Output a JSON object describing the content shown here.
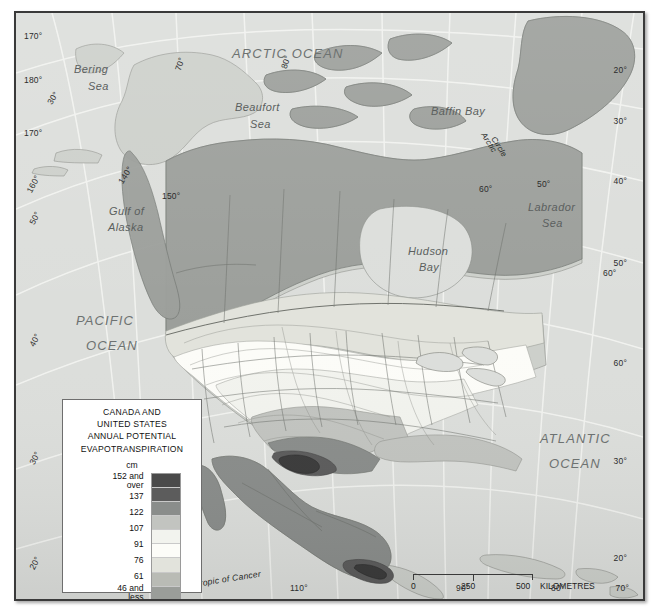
{
  "map": {
    "title_lines": [
      "CANADA AND",
      "UNITED STATES",
      "ANNUAL POTENTIAL",
      "EVAPOTRANSPIRATION"
    ],
    "unit": "cm",
    "legend": {
      "classes": [
        {
          "label_top": "152 and",
          "label_bottom": "over",
          "color": "#4a4a4a"
        },
        {
          "label_top": "137",
          "label_bottom": "",
          "color": "#5c5c5c"
        },
        {
          "label_top": "122",
          "label_bottom": "",
          "color": "#8a8d8b"
        },
        {
          "label_top": "107",
          "label_bottom": "",
          "color": "#c2c4c0"
        },
        {
          "label_top": "91",
          "label_bottom": "",
          "color": "#f2f3ee"
        },
        {
          "label_top": "76",
          "label_bottom": "",
          "color": "#fcfcf8"
        },
        {
          "label_top": "61",
          "label_bottom": "",
          "color": "#e2e3dc"
        },
        {
          "label_top": "46 and",
          "label_bottom": "less",
          "color": "#b9bbb5"
        },
        {
          "label_top": "",
          "label_bottom": "",
          "color": "#9a9d99"
        }
      ]
    },
    "scale": {
      "ticks": [
        "0",
        "250",
        "500"
      ],
      "unit_label": "KILOMETRES"
    },
    "features": [
      {
        "name": "arctic-ocean",
        "text": "ARCTIC OCEAN",
        "style": "big"
      },
      {
        "name": "pacific-ocean",
        "text": "PACIFIC",
        "style": "big"
      },
      {
        "name": "pacific-ocean-2",
        "text": "OCEAN",
        "style": "big"
      },
      {
        "name": "atlantic-ocean",
        "text": "ATLANTIC",
        "style": "big"
      },
      {
        "name": "atlantic-ocean-2",
        "text": "OCEAN",
        "style": "big"
      },
      {
        "name": "bering-sea",
        "text": "Bering",
        "style": "mid"
      },
      {
        "name": "bering-sea-2",
        "text": "Sea",
        "style": "mid"
      },
      {
        "name": "beaufort-sea",
        "text": "Beaufort",
        "style": "mid"
      },
      {
        "name": "beaufort-sea-2",
        "text": "Sea",
        "style": "mid"
      },
      {
        "name": "baffin-bay",
        "text": "Baffin Bay",
        "style": "mid"
      },
      {
        "name": "labrador-sea",
        "text": "Labrador",
        "style": "mid"
      },
      {
        "name": "labrador-sea-2",
        "text": "Sea",
        "style": "mid"
      },
      {
        "name": "hudson-bay",
        "text": "Hudson",
        "style": "mid"
      },
      {
        "name": "hudson-bay-2",
        "text": "Bay",
        "style": "mid"
      },
      {
        "name": "gulf-of-alaska",
        "text": "Gulf of",
        "style": "mid"
      },
      {
        "name": "gulf-of-alaska-2",
        "text": "Alaska",
        "style": "mid"
      }
    ],
    "line_labels": [
      {
        "name": "arctic-circle-label",
        "text": "Arctic"
      },
      {
        "name": "arctic-circle-label-2",
        "text": "Circle"
      },
      {
        "name": "tropic-of-cancer-label",
        "text": "Tropic of Cancer"
      }
    ],
    "coords": {
      "top": [
        "70°",
        "80°"
      ],
      "left": [
        "170°",
        "180°",
        "170°",
        "160°",
        "50°",
        "40°",
        "30°",
        "20°"
      ],
      "right": [
        "20°",
        "30°",
        "40°",
        "50°",
        "60°",
        "60°",
        "50°"
      ],
      "bottom": [
        "130°",
        "120°",
        "110°",
        "100°",
        "90°",
        "80°",
        "70°"
      ],
      "interior": [
        "70°",
        "60°",
        "150°",
        "140°",
        "60°",
        "50°",
        "80°",
        "20°",
        "30°"
      ]
    }
  }
}
